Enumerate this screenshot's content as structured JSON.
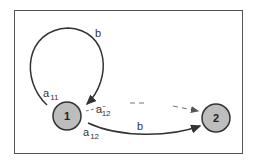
{
  "diagram": {
    "nodes": [
      {
        "id": "1",
        "label": "1"
      },
      {
        "id": "2",
        "label": "2"
      }
    ],
    "edges": [
      {
        "from": "1",
        "to": "1",
        "label": "b",
        "style": "solid",
        "type": "self-loop"
      },
      {
        "from": "1",
        "to": "2",
        "label": "b",
        "style": "solid"
      },
      {
        "from": "1",
        "to": "2",
        "label": "",
        "style": "dashed"
      }
    ],
    "annotations": {
      "a11": {
        "base": "a",
        "sub": "11"
      },
      "a12": {
        "base": "a",
        "sub": "12"
      },
      "a12_tilde": {
        "base": "a",
        "sub": "12",
        "sup": "~"
      }
    },
    "colors": {
      "node_fill": "#bdbdbd",
      "stroke": "#333333"
    }
  }
}
